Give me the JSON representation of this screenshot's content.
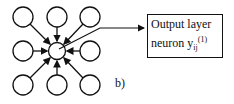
{
  "diagram": {
    "box": {
      "line1": "Output layer",
      "line2": "neuron y",
      "subscript": "ij",
      "superscript": "(1)"
    },
    "panel_label": "b)",
    "nodes": [
      {
        "id": "n00",
        "cx": 23,
        "cy": 17
      },
      {
        "id": "n01",
        "cx": 57,
        "cy": 17
      },
      {
        "id": "n02",
        "cx": 90,
        "cy": 17
      },
      {
        "id": "n10",
        "cx": 23,
        "cy": 51
      },
      {
        "id": "center",
        "cx": 57,
        "cy": 51
      },
      {
        "id": "n12",
        "cx": 90,
        "cy": 51
      },
      {
        "id": "n20",
        "cx": 23,
        "cy": 85
      },
      {
        "id": "n21",
        "cx": 57,
        "cy": 85
      },
      {
        "id": "n22",
        "cx": 90,
        "cy": 85
      }
    ],
    "colors": {
      "stroke": "#111111",
      "background": "#ffffff"
    }
  }
}
